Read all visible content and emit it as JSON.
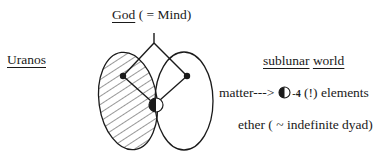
{
  "labels": {
    "god": "God",
    "god_gloss": " ( = Mind)",
    "uranos": "Uranos",
    "sublunar": "sublunar",
    "world": "world",
    "matter": "matter--->",
    "matter_count": "-4",
    "matter_tail": " (!) elements",
    "ether": "ether ( ~ indefinite dyad)"
  },
  "diagram": {
    "left_ellipse": {
      "name": "Uranos",
      "cx": 128,
      "cy": 101,
      "rx": 29,
      "ry": 49,
      "hatched": true
    },
    "right_ellipse": {
      "name": "sublunar world",
      "cx": 184,
      "cy": 101,
      "rx": 29,
      "ry": 49,
      "hatched": false
    },
    "apex": {
      "x": 154,
      "y": 43
    },
    "stem_top": {
      "x": 154,
      "y": 33
    },
    "left_node": {
      "x": 123,
      "y": 76
    },
    "right_node": {
      "x": 187,
      "y": 76
    },
    "center_node": {
      "x": 156,
      "y": 105,
      "r": 7,
      "style": "half-filled-left"
    },
    "colors": {
      "stroke": "#1a1a1a",
      "background": "#ffffff"
    }
  }
}
